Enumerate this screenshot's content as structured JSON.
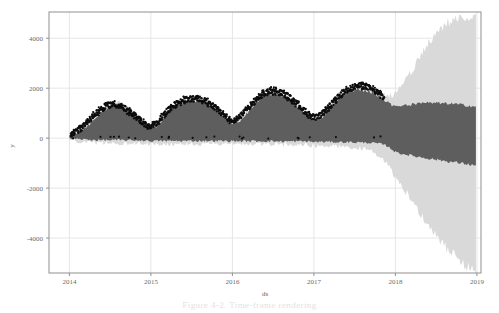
{
  "figure": {
    "caption": "Figure 4-2.  Time-frame rendering",
    "alt_name": "prophet-forecast-plot"
  },
  "chart_data": {
    "type": "line",
    "title": "",
    "subtitle": "",
    "xlabel": "ds",
    "ylabel": "y",
    "grid": true,
    "legend_position": "none",
    "xlim": [
      2013.75,
      2019.05
    ],
    "ylim": [
      -5400,
      5050
    ],
    "xticks": [
      2014,
      2015,
      2016,
      2017,
      2018,
      2019
    ],
    "xtick_labels": [
      "2014",
      "2015",
      "2016",
      "2017",
      "2018",
      "2019"
    ],
    "yticks": [
      4000,
      2000,
      0,
      -2000,
      -4000
    ],
    "ytick_labels": [
      "4000",
      "2000",
      "0",
      "-2000",
      "-4000"
    ],
    "colors": {
      "observations": "#0d0d0d",
      "forecast_band": "#5e5e5e",
      "uncertainty_band": "#d9d9d9",
      "grid": "#e6e6e6",
      "axis": "#8f8f8f",
      "tick_text": "#6b6b6b"
    },
    "history_end_x": 2017.92,
    "series": [
      {
        "name": "yhat_upper_dark",
        "kind": "band-upper",
        "x": [
          2014.0,
          2014.05,
          2014.1,
          2014.15,
          2014.2,
          2014.25,
          2014.3,
          2014.35,
          2014.4,
          2014.45,
          2014.5,
          2014.55,
          2014.6,
          2014.65,
          2014.7,
          2014.75,
          2014.8,
          2014.85,
          2014.9,
          2014.95,
          2015.0,
          2015.05,
          2015.1,
          2015.15,
          2015.2,
          2015.25,
          2015.3,
          2015.35,
          2015.4,
          2015.45,
          2015.5,
          2015.55,
          2015.6,
          2015.65,
          2015.7,
          2015.75,
          2015.8,
          2015.85,
          2015.9,
          2015.95,
          2016.0,
          2016.05,
          2016.1,
          2016.15,
          2016.2,
          2016.25,
          2016.3,
          2016.35,
          2016.4,
          2016.45,
          2016.5,
          2016.55,
          2016.6,
          2016.65,
          2016.7,
          2016.75,
          2016.8,
          2016.85,
          2016.9,
          2016.95,
          2017.0,
          2017.05,
          2017.1,
          2017.15,
          2017.2,
          2017.25,
          2017.3,
          2017.35,
          2017.4,
          2017.45,
          2017.5,
          2017.55,
          2017.6,
          2017.65,
          2017.7,
          2017.75,
          2017.8,
          2017.85,
          2017.9,
          2017.95,
          2018.0,
          2018.1,
          2018.2,
          2018.3,
          2018.4,
          2018.5,
          2018.6,
          2018.7,
          2018.8,
          2018.9,
          2019.0
        ],
        "values": [
          60,
          130,
          230,
          330,
          430,
          560,
          700,
          880,
          1050,
          1180,
          1270,
          1310,
          1300,
          1240,
          1150,
          1030,
          900,
          760,
          620,
          480,
          400,
          430,
          560,
          760,
          960,
          1120,
          1250,
          1360,
          1440,
          1480,
          1500,
          1500,
          1480,
          1430,
          1350,
          1240,
          1110,
          960,
          810,
          680,
          600,
          620,
          720,
          880,
          1060,
          1260,
          1450,
          1600,
          1700,
          1760,
          1780,
          1760,
          1700,
          1620,
          1520,
          1400,
          1260,
          1100,
          940,
          800,
          700,
          720,
          840,
          1010,
          1190,
          1360,
          1520,
          1660,
          1770,
          1850,
          1900,
          1930,
          1930,
          1900,
          1850,
          1780,
          1690,
          1580,
          1460,
          1340,
          1240,
          1300,
          1350,
          1380,
          1400,
          1400,
          1390,
          1370,
          1340,
          1300,
          1250
        ]
      },
      {
        "name": "yhat_lower_dark",
        "kind": "band-lower",
        "values": [
          -20,
          -30,
          -40,
          -50,
          -60,
          -70,
          -70,
          -80,
          -80,
          -80,
          -80,
          -80,
          -80,
          -80,
          -80,
          -90,
          -90,
          -90,
          -90,
          -100,
          -110,
          -110,
          -110,
          -110,
          -110,
          -110,
          -110,
          -110,
          -110,
          -110,
          -110,
          -110,
          -110,
          -110,
          -110,
          -110,
          -110,
          -110,
          -110,
          -120,
          -120,
          -120,
          -120,
          -120,
          -120,
          -120,
          -120,
          -120,
          -120,
          -120,
          -120,
          -130,
          -130,
          -130,
          -130,
          -130,
          -130,
          -130,
          -130,
          -140,
          -150,
          -150,
          -150,
          -150,
          -150,
          -150,
          -160,
          -160,
          -160,
          -160,
          -170,
          -170,
          -180,
          -180,
          -190,
          -200,
          -220,
          -260,
          -320,
          -420,
          -560,
          -640,
          -700,
          -760,
          -810,
          -860,
          -910,
          -960,
          -1000,
          -1050,
          -1100
        ]
      },
      {
        "name": "uncertainty_upper",
        "kind": "band-upper",
        "values": [
          90,
          170,
          280,
          390,
          500,
          640,
          790,
          970,
          1140,
          1280,
          1370,
          1410,
          1400,
          1340,
          1250,
          1130,
          1000,
          860,
          720,
          580,
          500,
          530,
          660,
          860,
          1060,
          1220,
          1350,
          1460,
          1540,
          1580,
          1600,
          1600,
          1580,
          1530,
          1450,
          1340,
          1210,
          1060,
          910,
          780,
          700,
          720,
          820,
          980,
          1160,
          1360,
          1550,
          1700,
          1800,
          1860,
          1880,
          1860,
          1800,
          1720,
          1620,
          1500,
          1360,
          1200,
          1040,
          900,
          800,
          820,
          940,
          1110,
          1290,
          1460,
          1620,
          1760,
          1870,
          1950,
          2000,
          2030,
          2030,
          2000,
          1950,
          1880,
          1790,
          1700,
          1680,
          1700,
          1750,
          2200,
          2700,
          3250,
          3750,
          4200,
          4550,
          4750,
          4850,
          4880,
          4860
        ]
      },
      {
        "name": "uncertainty_lower",
        "kind": "band-lower",
        "values": [
          -60,
          -90,
          -110,
          -130,
          -150,
          -170,
          -180,
          -190,
          -200,
          -200,
          -200,
          -200,
          -200,
          -200,
          -200,
          -210,
          -210,
          -210,
          -210,
          -220,
          -230,
          -230,
          -230,
          -230,
          -230,
          -230,
          -230,
          -230,
          -230,
          -230,
          -230,
          -230,
          -230,
          -230,
          -230,
          -230,
          -230,
          -230,
          -230,
          -240,
          -240,
          -240,
          -240,
          -240,
          -240,
          -240,
          -250,
          -250,
          -250,
          -250,
          -250,
          -260,
          -260,
          -260,
          -260,
          -260,
          -260,
          -260,
          -270,
          -280,
          -300,
          -300,
          -300,
          -310,
          -310,
          -320,
          -330,
          -340,
          -350,
          -360,
          -380,
          -400,
          -430,
          -470,
          -520,
          -600,
          -700,
          -850,
          -1050,
          -1300,
          -1550,
          -2000,
          -2500,
          -3000,
          -3450,
          -3900,
          -4300,
          -4650,
          -4950,
          -5200,
          -5350
        ]
      },
      {
        "name": "observations",
        "kind": "scatter",
        "x": [
          2014.02,
          2014.08,
          2014.14,
          2014.2,
          2014.26,
          2014.32,
          2014.38,
          2014.44,
          2014.5,
          2014.56,
          2014.62,
          2014.68,
          2014.74,
          2014.8,
          2014.86,
          2014.92,
          2014.98,
          2015.04,
          2015.1,
          2015.16,
          2015.22,
          2015.28,
          2015.34,
          2015.4,
          2015.46,
          2015.52,
          2015.58,
          2015.64,
          2015.7,
          2015.76,
          2015.82,
          2015.88,
          2015.94,
          2016.0,
          2016.06,
          2016.12,
          2016.18,
          2016.24,
          2016.3,
          2016.36,
          2016.42,
          2016.48,
          2016.54,
          2016.6,
          2016.66,
          2016.72,
          2016.78,
          2016.84,
          2016.9,
          2016.96,
          2017.02,
          2017.08,
          2017.14,
          2017.2,
          2017.26,
          2017.32,
          2017.38,
          2017.44,
          2017.5,
          2017.56,
          2017.62,
          2017.68,
          2017.74,
          2017.8,
          2017.86
        ],
        "values": [
          90,
          240,
          420,
          600,
          780,
          960,
          1130,
          1270,
          1340,
          1340,
          1280,
          1180,
          1050,
          900,
          740,
          560,
          430,
          520,
          700,
          930,
          1130,
          1300,
          1420,
          1510,
          1560,
          1580,
          1570,
          1520,
          1430,
          1300,
          1140,
          970,
          800,
          700,
          760,
          930,
          1150,
          1370,
          1570,
          1730,
          1840,
          1890,
          1880,
          1820,
          1720,
          1580,
          1410,
          1230,
          1050,
          900,
          820,
          900,
          1090,
          1300,
          1510,
          1700,
          1860,
          1980,
          2060,
          2100,
          2090,
          2030,
          1930,
          1790,
          1620
        ]
      }
    ],
    "annotations": []
  }
}
